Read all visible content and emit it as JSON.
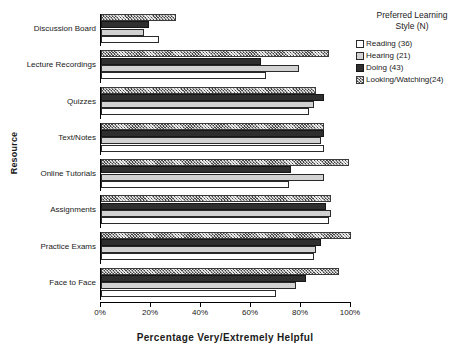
{
  "chart_data": {
    "type": "bar",
    "orientation": "horizontal",
    "title": "",
    "xlabel": "Percentage Very/Extremely Helpful",
    "ylabel": "Resource",
    "xlim": [
      0,
      100
    ],
    "xticks": [
      "0%",
      "20%",
      "40%",
      "60%",
      "80%",
      "100%"
    ],
    "xtick_values": [
      0,
      20,
      40,
      60,
      80,
      100
    ],
    "grid": false,
    "legend_position": "top-right",
    "legend_title": "Preferred Learning Style (N)",
    "categories": [
      "Discussion Board",
      "Lecture Recordings",
      "Quizzes",
      "Text/Notes",
      "Online Tutorials",
      "Assignments",
      "Practice Exams",
      "Face to Face"
    ],
    "series": [
      {
        "name": "Reading (36)",
        "label": "Reading",
        "n": 36,
        "pattern": "white",
        "values": [
          23,
          66,
          83,
          89,
          75,
          91,
          85,
          70
        ]
      },
      {
        "name": "Hearing (21)",
        "label": "Hearing",
        "n": 21,
        "pattern": "light-gray",
        "values": [
          17,
          79,
          85,
          88,
          89,
          92,
          86,
          78
        ]
      },
      {
        "name": "Doing (43)",
        "label": "Doing",
        "n": 43,
        "pattern": "dark-gray",
        "values": [
          19,
          64,
          89,
          89,
          76,
          90,
          88,
          82
        ]
      },
      {
        "name": "Looking/Watching(24)",
        "label": "Looking/Watching",
        "n": 24,
        "pattern": "crosshatch",
        "values": [
          30,
          91,
          86,
          89,
          99,
          92,
          100,
          95
        ]
      }
    ]
  },
  "legend": {
    "title_line1": "Preferred Learning",
    "title_line2": "Style (N)",
    "items": [
      {
        "label": "Reading (36)",
        "pattern": "s-reading"
      },
      {
        "label": "Hearing (21)",
        "pattern": "s-hearing"
      },
      {
        "label": "Doing (43)",
        "pattern": "s-doing"
      },
      {
        "label": "Looking/Watching(24)",
        "pattern": "s-looking"
      }
    ]
  }
}
